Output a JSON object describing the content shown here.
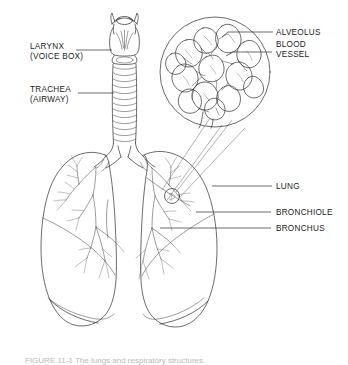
{
  "figure": {
    "background_color": "#ffffff",
    "line_color": "#2b2b2b",
    "text_color": "#1a1a1a",
    "caption": "FIGURE 11-1   The lungs and respiratory structures.",
    "caption_color": "#b9b9b9"
  },
  "labels": {
    "larynx_line1": "LARYNX",
    "larynx_line2": "(VOICE BOX)",
    "trachea_line1": "TRACHEA",
    "trachea_line2": "(AIRWAY)",
    "alveolus": "ALVEOLUS",
    "blood_vessel_line1": "BLOOD",
    "blood_vessel_line2": "VESSEL",
    "lung": "LUNG",
    "bronchiole": "BRONCHIOLE",
    "bronchus": "BRONCHUS"
  },
  "structures": {
    "larynx": "larynx-illustration",
    "trachea": "trachea-illustration",
    "left_lung": "left-lung-illustration",
    "right_lung": "right-lung-illustration",
    "bronchial_tree": "bronchial-tree-illustration",
    "alveolus_inset": "alveolus-magnified-inset",
    "alveolus_marker": "alveolus-marker-circle"
  }
}
